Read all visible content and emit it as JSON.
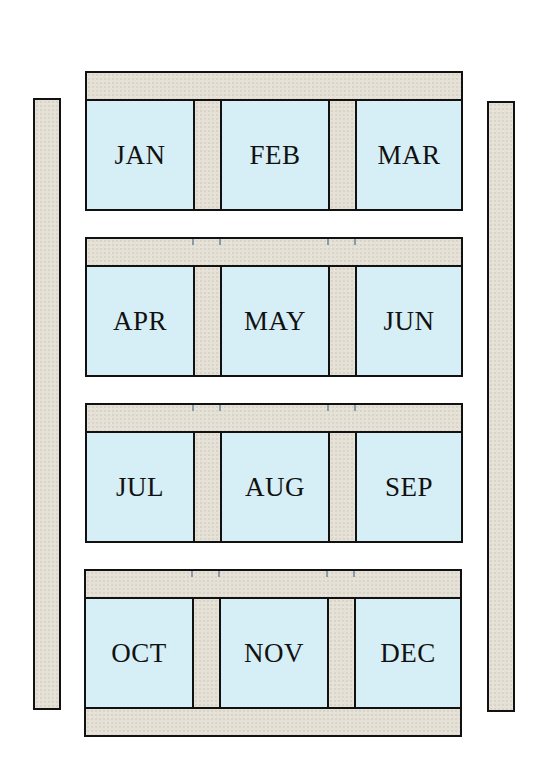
{
  "diagram": {
    "colors": {
      "frame": "#e5e1d6",
      "compartment": "#d6eef5",
      "outline": "#111111",
      "tick": "#8a9aa8"
    },
    "rows": [
      {
        "cells": [
          {
            "label": "JAN"
          },
          {
            "label": "FEB"
          },
          {
            "label": "MAR"
          }
        ]
      },
      {
        "cells": [
          {
            "label": "APR"
          },
          {
            "label": "MAY"
          },
          {
            "label": "JUN"
          }
        ]
      },
      {
        "cells": [
          {
            "label": "JUL"
          },
          {
            "label": "AUG"
          },
          {
            "label": "SEP"
          }
        ]
      },
      {
        "cells": [
          {
            "label": "OCT"
          },
          {
            "label": "NOV"
          },
          {
            "label": "DEC"
          }
        ]
      }
    ]
  }
}
